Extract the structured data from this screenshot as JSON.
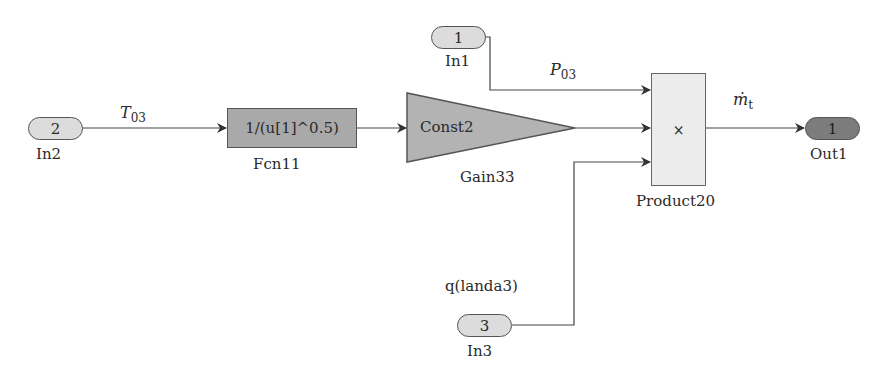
{
  "diagram": {
    "type": "simulink-block-diagram",
    "inports": [
      {
        "id": "in1",
        "number": "1",
        "name": "In1"
      },
      {
        "id": "in2",
        "number": "2",
        "name": "In2"
      },
      {
        "id": "in3",
        "number": "3",
        "name": "In3"
      }
    ],
    "outports": [
      {
        "id": "out1",
        "number": "1",
        "name": "Out1"
      }
    ],
    "blocks": {
      "fcn": {
        "expression": "1/(u[1]^0.5)",
        "name": "Fcn11"
      },
      "gain": {
        "value": "Const2",
        "name": "Gain33"
      },
      "product": {
        "symbol": "×",
        "name": "Product20"
      }
    },
    "signals": {
      "t03": {
        "base": "T",
        "sub": "03"
      },
      "p03": {
        "base": "P",
        "sub": "03"
      },
      "mt": {
        "base": "ṁ",
        "sub": "t"
      },
      "q": {
        "label": "q(landa3)"
      }
    },
    "colors": {
      "inport_fill": "#dcdcdc",
      "outport_fill": "#7c7c7c",
      "fcn_fill": "#a9a9a9",
      "gain_fill": "#b3b3b3",
      "product_fill": "#ececec",
      "wire": "#444444"
    }
  }
}
